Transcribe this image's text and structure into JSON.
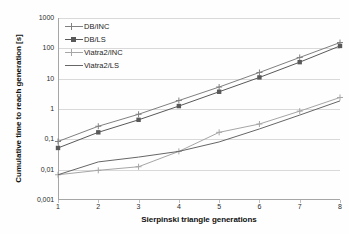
{
  "chart_data": {
    "type": "line",
    "title": "",
    "xlabel": "Sierpinski triangle generations",
    "ylabel": "Cumulative time to reach generation [s]",
    "x": [
      1,
      2,
      3,
      4,
      5,
      6,
      7,
      8
    ],
    "categories": [
      "1",
      "2",
      "3",
      "4",
      "5",
      "6",
      "7",
      "8"
    ],
    "xlim": [
      1,
      8
    ],
    "ylim": [
      0.001,
      1000
    ],
    "yscale": "log",
    "grid": "horizontal",
    "legend_position": "upper-left-inside",
    "ytick_labels": [
      "1000",
      "100",
      "10",
      "1",
      "0,1",
      "0,01",
      "0,001"
    ],
    "ytick_values": [
      1000,
      100,
      10,
      1,
      0.1,
      0.01,
      0.001
    ],
    "xtick_labels": [
      "1",
      "2",
      "3",
      "4",
      "5",
      "6",
      "7",
      "8"
    ],
    "series": [
      {
        "name": "DB/INC",
        "marker": "plus",
        "color": "#808080",
        "values": [
          0.085,
          0.27,
          0.67,
          1.9,
          5.3,
          16.0,
          50.0,
          155.0
        ]
      },
      {
        "name": "DB/LS",
        "marker": "square",
        "color": "#595959",
        "values": [
          0.052,
          0.17,
          0.44,
          1.25,
          3.7,
          11.0,
          35.0,
          120.0
        ]
      },
      {
        "name": "Viatra2/INC",
        "marker": "plus",
        "color": "#a6a6a6",
        "values": [
          0.0068,
          0.0095,
          0.0125,
          0.04,
          0.17,
          0.32,
          0.85,
          2.4
        ]
      },
      {
        "name": "Viatra2/LS",
        "marker": "none",
        "color": "#666666",
        "values": [
          0.0068,
          0.018,
          0.026,
          0.04,
          0.082,
          0.22,
          0.63,
          1.85
        ]
      }
    ]
  },
  "legend": {
    "items": [
      {
        "label": "DB/INC"
      },
      {
        "label": "DB/LS"
      },
      {
        "label": "Viatra2/INC"
      },
      {
        "label": "Viatra2/LS"
      }
    ]
  },
  "axes": {
    "x_title": "Sierpinski triangle generations",
    "y_title": "Cumulative time to reach generation [s]"
  },
  "colors": {
    "gridline": "#d9d9d9",
    "axis": "#a6a6a6",
    "text": "#1a1a1a",
    "background": "#ffffff"
  }
}
